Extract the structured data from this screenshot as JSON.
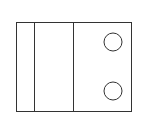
{
  "diagram": {
    "stroke_color": "#333333",
    "background": "#ffffff",
    "outer_rect": {
      "x": 16,
      "y": 22,
      "width": 115,
      "height": 89
    },
    "dividers": [
      {
        "x": 34
      },
      {
        "x": 73
      }
    ],
    "circles": [
      {
        "cx": 113,
        "cy": 42,
        "r": 9
      },
      {
        "cx": 113,
        "cy": 91,
        "r": 9
      }
    ]
  }
}
